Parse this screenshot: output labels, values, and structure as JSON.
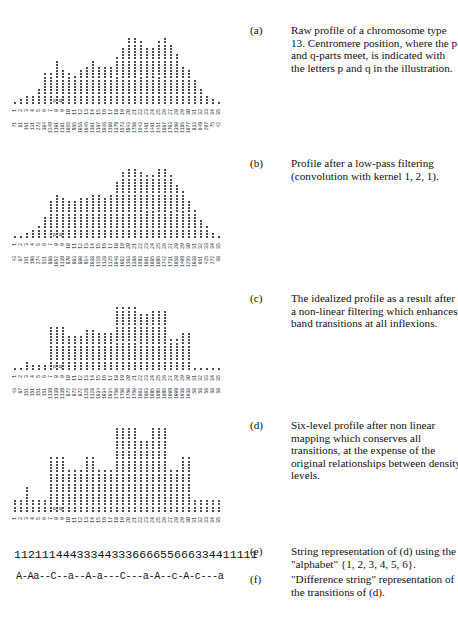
{
  "figure": {
    "top_fragment": "",
    "pq_marker": "p q",
    "centromere_column": 8
  },
  "chart_data": [
    {
      "id": "a",
      "type": "bar",
      "style": "dot-column",
      "title": "Raw profile of a chromosome type 13",
      "x": [
        1,
        2,
        3,
        4,
        5,
        6,
        7,
        8,
        9,
        10,
        11,
        12,
        13,
        14,
        15,
        16,
        17,
        18,
        19,
        20,
        21,
        22,
        23,
        24,
        25,
        26,
        27,
        28,
        29,
        30,
        31,
        32,
        33,
        34,
        35
      ],
      "dot_counts": [
        1,
        2,
        3,
        3,
        5,
        10,
        10,
        14,
        11,
        10,
        9,
        11,
        12,
        14,
        12,
        12,
        12,
        15,
        18,
        21,
        21,
        20,
        18,
        18,
        20,
        21,
        19,
        16,
        12,
        11,
        8,
        5,
        3,
        2,
        1
      ],
      "value_labels": [
        "71",
        "81",
        "161",
        "131",
        "272",
        "304",
        "1249",
        "1101",
        "1161",
        "1015",
        "955",
        "1016",
        "1045",
        "1101",
        "1167",
        "1026",
        "1188",
        "1379",
        "1573",
        "1843",
        "1758",
        "1543",
        "1461",
        "1461",
        "1451",
        "1667",
        "1703",
        "1350",
        "1185",
        "1077",
        "833",
        "649",
        "207",
        "75",
        "42"
      ]
    },
    {
      "id": "b",
      "type": "bar",
      "style": "dot-column",
      "title": "Profile after a low-pass filtering",
      "x": [
        1,
        2,
        3,
        4,
        5,
        6,
        7,
        8,
        9,
        10,
        11,
        12,
        13,
        14,
        15,
        16,
        17,
        18,
        19,
        20,
        21,
        22,
        23,
        24,
        25,
        26,
        27,
        28,
        29,
        30,
        31,
        32,
        33,
        34,
        35
      ],
      "dot_counts": [
        1,
        1,
        2,
        3,
        4,
        7,
        12,
        14,
        13,
        12,
        12,
        13,
        13,
        14,
        14,
        13,
        14,
        18,
        21,
        22,
        22,
        21,
        20,
        20,
        22,
        22,
        20,
        17,
        15,
        12,
        9,
        6,
        4,
        2,
        1
      ],
      "value_labels": [
        "43",
        "87",
        "151",
        "196",
        "274",
        "511",
        "886",
        "1052",
        "1139",
        "870",
        "803",
        "800",
        "914",
        "1038",
        "1118",
        "1128",
        "1125",
        "1046",
        "1082",
        "1163",
        "1366",
        "1593",
        "1661",
        "1685",
        "1695",
        "1742",
        "1731",
        "1658",
        "1409",
        "1255",
        "1038",
        "651",
        "425",
        "272",
        "58"
      ]
    },
    {
      "id": "c",
      "type": "bar",
      "style": "dot-column",
      "title": "The idealized profile",
      "x": [
        1,
        2,
        3,
        4,
        5,
        6,
        7,
        8,
        9,
        10,
        11,
        12,
        13,
        14,
        15,
        16,
        17,
        18,
        19,
        20,
        21,
        22,
        23,
        24,
        25,
        26,
        27,
        28,
        29,
        30,
        31,
        32,
        33,
        34,
        35
      ],
      "dot_counts": [
        1,
        1,
        3,
        2,
        2,
        2,
        14,
        14,
        14,
        11,
        11,
        11,
        13,
        13,
        12,
        12,
        12,
        20,
        20,
        20,
        20,
        18,
        18,
        19,
        19,
        19,
        10,
        10,
        12,
        12,
        1,
        1,
        1,
        1,
        1
      ],
      "value_labels": [
        "43",
        "87",
        "151",
        "151",
        "151",
        "151",
        "1139",
        "1139",
        "1139",
        "872",
        "872",
        "872",
        "1128",
        "1128",
        "1034",
        "1034",
        "1034",
        "1750",
        "1750",
        "1750",
        "1750",
        "1603",
        "1603",
        "1695",
        "1695",
        "1695",
        "1009",
        "1009",
        "1038",
        "1038",
        "58",
        "58",
        "58",
        "58",
        "58"
      ]
    },
    {
      "id": "d",
      "type": "bar",
      "style": "dot-column",
      "title": "Six-level profile",
      "x": [
        1,
        2,
        3,
        4,
        5,
        6,
        7,
        8,
        9,
        10,
        11,
        12,
        13,
        14,
        15,
        16,
        17,
        18,
        19,
        20,
        21,
        22,
        23,
        24,
        25,
        26,
        27,
        28,
        29,
        30,
        31,
        32,
        33,
        34,
        35
      ],
      "levels": [
        1,
        1,
        2,
        1,
        1,
        1,
        4,
        4,
        4,
        3,
        3,
        3,
        4,
        4,
        3,
        3,
        3,
        6,
        6,
        6,
        6,
        5,
        5,
        6,
        6,
        6,
        3,
        3,
        4,
        4,
        1,
        1,
        1,
        1,
        1
      ],
      "dot_counts": [
        4,
        4,
        8,
        4,
        4,
        4,
        17,
        17,
        17,
        13,
        13,
        13,
        17,
        17,
        13,
        13,
        13,
        26,
        26,
        26,
        26,
        22,
        22,
        26,
        26,
        26,
        13,
        13,
        17,
        17,
        4,
        4,
        4,
        4,
        4
      ]
    }
  ],
  "strings": {
    "e": "11211144433344333666655666334411111",
    "f": "A-Aa--C--a--A-a---C---a-A--c-A-c---a"
  },
  "captions": [
    {
      "label": "(a)",
      "text": "Raw profile of a chromosome type 13. Centromere position, where the  p- and q-parts meet, is indicated with the letters p and q in the illustration."
    },
    {
      "label": "(b)",
      "text": "Profile after a low-pass filtering (convolution with kernel 1, 2, 1)."
    },
    {
      "label": "(c)",
      "text": "The idealized profile as a result after a non-linear filtering which enhances band transitions at all inflexions."
    },
    {
      "label": "(d)",
      "text": "Six-level profile after non linear mapping which conserves all transitions,  at the expense of the original relationships between density levels."
    },
    {
      "label": "(e)",
      "text": "String representation of (d) using the \"alphabet\" {1, 2, 3, 4, 5, 6}."
    },
    {
      "label": "(f)",
      "text": "\"Difference string\" representation of the transitions of (d)."
    }
  ]
}
